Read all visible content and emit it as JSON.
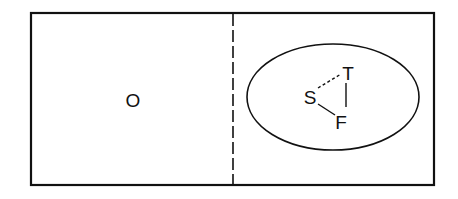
{
  "diagram": {
    "left_region": {
      "label": "O"
    },
    "right_region": {
      "ellipse": {
        "nodes": {
          "s": "S",
          "t": "T",
          "f": "F"
        },
        "edges": [
          {
            "from": "S",
            "to": "T",
            "style": "dashed"
          },
          {
            "from": "T",
            "to": "F",
            "style": "solid"
          },
          {
            "from": "S",
            "to": "F",
            "style": "solid"
          }
        ]
      }
    },
    "divider": {
      "style": "dashed"
    },
    "colors": {
      "stroke": "#111111",
      "background": "#ffffff"
    }
  }
}
